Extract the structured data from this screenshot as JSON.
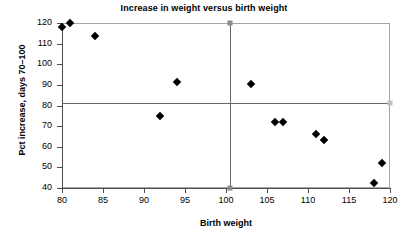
{
  "chart_data": {
    "type": "scatter",
    "title": "Increase in weight versus birth weight",
    "xlabel": "Birth weight",
    "ylabel": "Pct increase, days 70–100",
    "xlim": [
      80,
      120
    ],
    "ylim": [
      40,
      120
    ],
    "xticks": [
      80,
      85,
      90,
      95,
      100,
      105,
      110,
      115,
      120
    ],
    "yticks": [
      40,
      50,
      60,
      70,
      80,
      90,
      100,
      110,
      120
    ],
    "grid": false,
    "legend": "none",
    "marker": "diamond",
    "marker_color": "#000000",
    "reference_lines": [
      {
        "name": "horizontal-mean-line",
        "orientation": "horizontal",
        "value": 81,
        "color": "#666666"
      },
      {
        "name": "vertical-mean-line",
        "orientation": "vertical",
        "value": 100.5,
        "color": "#666666"
      }
    ],
    "points": [
      {
        "x": 80,
        "y": 118
      },
      {
        "x": 81,
        "y": 120
      },
      {
        "x": 84,
        "y": 113.7
      },
      {
        "x": 94,
        "y": 91.2
      },
      {
        "x": 92,
        "y": 74.8
      },
      {
        "x": 103,
        "y": 90.2
      },
      {
        "x": 106,
        "y": 72
      },
      {
        "x": 107,
        "y": 72
      },
      {
        "x": 111,
        "y": 66
      },
      {
        "x": 112,
        "y": 63.3
      },
      {
        "x": 119,
        "y": 52
      },
      {
        "x": 118,
        "y": 42.5
      }
    ]
  }
}
